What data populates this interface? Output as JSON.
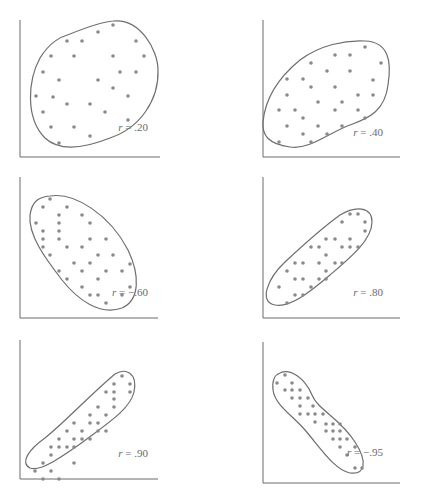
{
  "chart_data": [
    {
      "type": "scatter",
      "title": "",
      "label": "r = .20",
      "r": 0.2,
      "xlabel": "",
      "ylabel": "",
      "grid": false,
      "axes": {
        "x0": 20,
        "y0": 157,
        "x1": 160,
        "ytop": 20
      },
      "envelope": "M 70 34 C 85 28, 100 22, 113 21 C 140 18, 158 50, 158 70 C 159 100, 140 128, 110 138 C 85 148, 60 152, 45 138 C 25 118, 28 80, 40 58 C 50 42, 60 37, 70 34 Z",
      "label_pos": [
        148,
        131
      ],
      "points": [
        [
          113,
          25
        ],
        [
          98,
          32
        ],
        [
          67,
          41
        ],
        [
          82,
          41
        ],
        [
          136,
          41
        ],
        [
          51,
          56
        ],
        [
          74,
          56
        ],
        [
          113,
          56
        ],
        [
          144,
          56
        ],
        [
          43,
          72
        ],
        [
          120,
          72
        ],
        [
          136,
          72
        ],
        [
          59,
          80
        ],
        [
          98,
          80
        ],
        [
          113,
          88
        ],
        [
          36,
          96
        ],
        [
          53,
          97
        ],
        [
          128,
          96
        ],
        [
          67,
          104
        ],
        [
          90,
          104
        ],
        [
          43,
          112
        ],
        [
          105,
          112
        ],
        [
          128,
          120
        ],
        [
          51,
          127
        ],
        [
          74,
          127
        ],
        [
          90,
          136
        ],
        [
          59,
          143
        ]
      ]
    },
    {
      "type": "scatter",
      "title": "",
      "label": "r = .40",
      "r": 0.4,
      "xlabel": "",
      "ylabel": "",
      "grid": false,
      "axes": {
        "x0": 263,
        "y0": 157,
        "x1": 400,
        "ytop": 20
      },
      "envelope": "M 300 60 C 320 45, 345 40, 365 41 C 388 42, 392 60, 388 85 C 385 110, 370 118, 350 125 C 330 132, 310 150, 290 147 C 268 144, 262 135, 263 122 C 265 100, 278 78, 300 60 Z",
      "label_pos": [
        383,
        136
      ],
      "points": [
        [
          365,
          47
        ],
        [
          335,
          55
        ],
        [
          350,
          55
        ],
        [
          381,
          63
        ],
        [
          311,
          63
        ],
        [
          327,
          71
        ],
        [
          350,
          71
        ],
        [
          373,
          80
        ],
        [
          287,
          79
        ],
        [
          303,
          79
        ],
        [
          311,
          87
        ],
        [
          335,
          87
        ],
        [
          358,
          95
        ],
        [
          373,
          95
        ],
        [
          287,
          95
        ],
        [
          279,
          110
        ],
        [
          295,
          110
        ],
        [
          318,
          102
        ],
        [
          342,
          102
        ],
        [
          335,
          110
        ],
        [
          358,
          110
        ],
        [
          365,
          118
        ],
        [
          303,
          118
        ],
        [
          287,
          126
        ],
        [
          318,
          126
        ],
        [
          342,
          126
        ],
        [
          303,
          134
        ],
        [
          327,
          134
        ],
        [
          279,
          142
        ],
        [
          311,
          142
        ]
      ]
    },
    {
      "type": "scatter",
      "title": "",
      "label": "r = −.60",
      "r": -0.6,
      "xlabel": "",
      "ylabel": "",
      "grid": false,
      "axes": {
        "x0": 20,
        "y0": 318,
        "x1": 158,
        "ytop": 177
      },
      "envelope": "M 50 196 C 75 192, 110 215, 128 250 C 140 275, 140 300, 122 308 C 100 316, 78 300, 62 280 C 45 258, 28 235, 30 215 C 32 200, 40 197, 50 196 Z",
      "label_pos": [
        148,
        296
      ],
      "points": [
        [
          50,
          199
        ],
        [
          43,
          207
        ],
        [
          67,
          207
        ],
        [
          59,
          215
        ],
        [
          82,
          215
        ],
        [
          36,
          223
        ],
        [
          59,
          223
        ],
        [
          90,
          223
        ],
        [
          43,
          231
        ],
        [
          59,
          231
        ],
        [
          43,
          239
        ],
        [
          59,
          239
        ],
        [
          90,
          239
        ],
        [
          106,
          239
        ],
        [
          43,
          247
        ],
        [
          67,
          247
        ],
        [
          82,
          247
        ],
        [
          50,
          255
        ],
        [
          98,
          255
        ],
        [
          113,
          255
        ],
        [
          74,
          263
        ],
        [
          90,
          263
        ],
        [
          130,
          264
        ],
        [
          59,
          271
        ],
        [
          82,
          271
        ],
        [
          106,
          271
        ],
        [
          122,
          271
        ],
        [
          67,
          279
        ],
        [
          98,
          279
        ],
        [
          82,
          287
        ],
        [
          130,
          287
        ],
        [
          90,
          295
        ],
        [
          98,
          295
        ],
        [
          122,
          295
        ],
        [
          106,
          303
        ]
      ]
    },
    {
      "type": "scatter",
      "title": "",
      "label": "r = .80",
      "r": 0.8,
      "xlabel": "",
      "ylabel": "",
      "grid": false,
      "axes": {
        "x0": 263,
        "y0": 318,
        "x1": 400,
        "ytop": 177
      },
      "envelope": "M 340 215 C 355 206, 372 206, 372 222 C 372 240, 350 258, 330 275 C 310 292, 290 308, 275 305 C 258 302, 268 278, 285 262 C 300 248, 322 228, 340 215 Z",
      "label_pos": [
        383,
        296
      ],
      "points": [
        [
          350,
          214
        ],
        [
          358,
          214
        ],
        [
          342,
          222
        ],
        [
          365,
          222
        ],
        [
          365,
          231
        ],
        [
          326,
          239
        ],
        [
          335,
          239
        ],
        [
          350,
          239
        ],
        [
          311,
          247
        ],
        [
          319,
          247
        ],
        [
          342,
          247
        ],
        [
          350,
          247
        ],
        [
          358,
          247
        ],
        [
          326,
          255
        ],
        [
          295,
          263
        ],
        [
          303,
          263
        ],
        [
          319,
          263
        ],
        [
          335,
          263
        ],
        [
          342,
          263
        ],
        [
          287,
          271
        ],
        [
          326,
          271
        ],
        [
          295,
          279
        ],
        [
          303,
          279
        ],
        [
          319,
          279
        ],
        [
          326,
          279
        ],
        [
          279,
          287
        ],
        [
          311,
          287
        ],
        [
          295,
          295
        ],
        [
          303,
          295
        ],
        [
          287,
          303
        ]
      ]
    },
    {
      "type": "scatter",
      "title": "",
      "label": "r = .90",
      "r": 0.9,
      "xlabel": "",
      "ylabel": "",
      "grid": false,
      "axes": {
        "x0": 20,
        "y0": 479,
        "x1": 158,
        "ytop": 340
      },
      "envelope": "M 115 374 C 125 368, 138 372, 134 392 C 130 410, 105 425, 80 444 C 60 458, 40 472, 30 468 C 20 463, 28 450, 45 438 C 65 422, 90 395, 115 374 Z",
      "label_pos": [
        148,
        457
      ],
      "points": [
        [
          122,
          376
        ],
        [
          114,
          384
        ],
        [
          130,
          384
        ],
        [
          106,
          392
        ],
        [
          114,
          392
        ],
        [
          130,
          392
        ],
        [
          114,
          399
        ],
        [
          98,
          407
        ],
        [
          114,
          407
        ],
        [
          90,
          415
        ],
        [
          106,
          415
        ],
        [
          90,
          423
        ],
        [
          98,
          423
        ],
        [
          74,
          423
        ],
        [
          82,
          431
        ],
        [
          98,
          431
        ],
        [
          106,
          431
        ],
        [
          67,
          431
        ],
        [
          82,
          439
        ],
        [
          59,
          439
        ],
        [
          74,
          439
        ],
        [
          90,
          439
        ],
        [
          59,
          447
        ],
        [
          51,
          447
        ],
        [
          67,
          447
        ],
        [
          74,
          447
        ],
        [
          51,
          455
        ],
        [
          74,
          463
        ],
        [
          43,
          463
        ],
        [
          51,
          471
        ],
        [
          35,
          471
        ],
        [
          43,
          479
        ],
        [
          59,
          479
        ]
      ]
    },
    {
      "type": "scatter",
      "title": "",
      "label": "r = −.95",
      "r": -0.95,
      "xlabel": "",
      "ylabel": "",
      "grid": false,
      "axes": {
        "x0": 263,
        "y0": 483,
        "x1": 400,
        "ytop": 342
      },
      "envelope": "M 280 373 C 290 368, 305 378, 312 395 C 318 410, 340 418, 355 442 C 368 462, 365 475, 350 473 C 335 470, 322 450, 305 430 C 292 415, 275 405, 273 390 C 272 380, 274 375, 280 373 Z",
      "label_pos": [
        383,
        456
      ],
      "points": [
        [
          285,
          375
        ],
        [
          277,
          383
        ],
        [
          292,
          383
        ],
        [
          285,
          390
        ],
        [
          292,
          390
        ],
        [
          300,
          390
        ],
        [
          292,
          398
        ],
        [
          300,
          398
        ],
        [
          308,
          398
        ],
        [
          300,
          406
        ],
        [
          313,
          406
        ],
        [
          300,
          414
        ],
        [
          308,
          414
        ],
        [
          315,
          414
        ],
        [
          323,
          414
        ],
        [
          315,
          422
        ],
        [
          326,
          424
        ],
        [
          333,
          424
        ],
        [
          340,
          424
        ],
        [
          326,
          431
        ],
        [
          333,
          431
        ],
        [
          340,
          431
        ],
        [
          333,
          439
        ],
        [
          340,
          439
        ],
        [
          347,
          439
        ],
        [
          340,
          447
        ],
        [
          355,
          447
        ],
        [
          347,
          455
        ],
        [
          355,
          468
        ],
        [
          362,
          468
        ]
      ]
    }
  ]
}
